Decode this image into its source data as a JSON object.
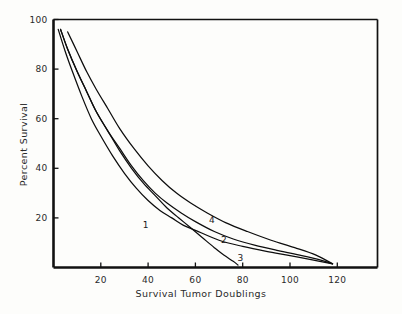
{
  "chart_data": {
    "type": "line",
    "title": "",
    "xlabel": "Survival Tumor Doublings",
    "ylabel": "Percent Survival",
    "xlim": [
      0,
      137
    ],
    "ylim": [
      0,
      100
    ],
    "grid": false,
    "legend_position": "inline-curve-labels",
    "xticks": [
      20,
      40,
      60,
      80,
      100,
      120
    ],
    "yticks": [
      20,
      40,
      60,
      80,
      100
    ],
    "xtick_labels": [
      "20",
      "40",
      "60",
      "80",
      "100",
      "120"
    ],
    "ytick_labels": [
      "20",
      "40",
      "60",
      "80",
      "100"
    ],
    "annotations": [
      {
        "text": "1",
        "x": 39,
        "y": 17
      },
      {
        "text": "2",
        "x": 72,
        "y": 11
      },
      {
        "text": "3",
        "x": 79,
        "y": 4
      },
      {
        "text": "4",
        "x": 67,
        "y": 19
      }
    ],
    "series": [
      {
        "name": "1",
        "label": "1",
        "x": [
          2,
          5,
          8,
          12,
          16,
          20,
          25,
          30,
          35,
          40,
          45,
          50,
          55,
          60,
          70,
          80,
          90,
          100,
          110,
          118
        ],
        "y": [
          96,
          87,
          79,
          69,
          60,
          53,
          45,
          38,
          32,
          27,
          23,
          20,
          17,
          15,
          11,
          8.5,
          6.5,
          4.8,
          3,
          1.5
        ]
      },
      {
        "name": "2",
        "label": "2",
        "x": [
          3,
          6,
          10,
          14,
          18,
          23,
          28,
          33,
          38,
          43,
          48,
          54,
          60,
          68,
          76,
          85,
          95,
          105,
          113,
          118
        ],
        "y": [
          96,
          88,
          79,
          71,
          63,
          55,
          48,
          41,
          35,
          30,
          26,
          22,
          18.5,
          14.5,
          11.5,
          9,
          6.8,
          4.8,
          3,
          1.5
        ]
      },
      {
        "name": "3",
        "label": "3",
        "x": [
          3,
          6,
          10,
          14,
          18,
          23,
          28,
          33,
          38,
          43,
          48,
          53,
          58,
          63,
          68,
          72,
          76,
          78
        ],
        "y": [
          96,
          88,
          79,
          71,
          63,
          55,
          47,
          40,
          34,
          29,
          24,
          20,
          16,
          12,
          8,
          5,
          2.5,
          1
        ]
      },
      {
        "name": "4",
        "label": "4",
        "x": [
          6,
          10,
          14,
          18,
          23,
          28,
          34,
          40,
          46,
          52,
          58,
          65,
          73,
          82,
          92,
          102,
          111,
          118
        ],
        "y": [
          95,
          87,
          79,
          72,
          64,
          56,
          48,
          41,
          35,
          30,
          26,
          22,
          18,
          14.5,
          11,
          8,
          5,
          1.5
        ]
      }
    ]
  }
}
